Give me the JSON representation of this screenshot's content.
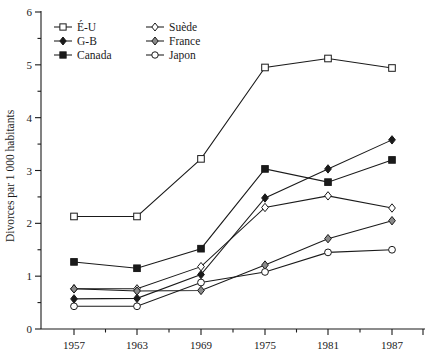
{
  "chart_data": {
    "type": "line",
    "title": "",
    "xlabel": "",
    "ylabel": "Divorces par 1 000 habitants",
    "x": [
      1957,
      1963,
      1969,
      1975,
      1981,
      1987
    ],
    "xticklabels": [
      "1957",
      "1963",
      "1969",
      "1975",
      "1981",
      "1987"
    ],
    "yticklabels": [
      "0",
      "1",
      "2",
      "3",
      "4",
      "5",
      "6"
    ],
    "ylim": [
      0,
      6
    ],
    "ytick_step": 1,
    "yminor_step": 0.5,
    "grid": false,
    "legend_position": "top-left",
    "series": [
      {
        "name": "É-U",
        "marker": "square-open",
        "values": [
          2.13,
          2.13,
          3.22,
          4.95,
          5.12,
          4.94
        ]
      },
      {
        "name": "G-B",
        "marker": "diamond-filled",
        "values": [
          0.57,
          0.58,
          1.03,
          2.48,
          3.03,
          3.58
        ]
      },
      {
        "name": "Canada",
        "marker": "square-filled",
        "values": [
          1.27,
          1.15,
          1.52,
          3.03,
          2.78,
          3.2
        ]
      },
      {
        "name": "Suède",
        "marker": "diamond-open",
        "values": [
          0.76,
          0.76,
          1.18,
          2.3,
          2.52,
          2.29
        ]
      },
      {
        "name": "France",
        "marker": "diamond-grey",
        "values": [
          0.76,
          0.72,
          0.73,
          1.21,
          1.71,
          2.05
        ]
      },
      {
        "name": "Japon",
        "marker": "circle-open",
        "values": [
          0.43,
          0.43,
          0.88,
          1.08,
          1.45,
          1.5
        ]
      }
    ]
  },
  "colors": {
    "ink": "#1a1a1a",
    "background": "#ffffff",
    "marker_fill_open": "#ffffff",
    "marker_fill_filled": "#1a1a1a",
    "marker_fill_grey": "#8a8a8a"
  },
  "legend": {
    "columns": [
      [
        "É-U",
        "G-B",
        "Canada"
      ],
      [
        "Suède",
        "France",
        "Japon"
      ]
    ]
  }
}
